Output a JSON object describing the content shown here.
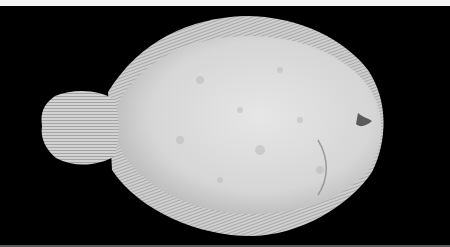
{
  "image": {
    "subject": "flatfish specimen, dorsal view, on black background",
    "background_color": "#000000",
    "top_border_color": "#f4f4f4",
    "fish_body_color": "#d9d9d9",
    "fin_color": "#cfcfcf"
  }
}
